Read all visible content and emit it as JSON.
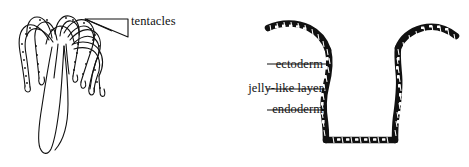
{
  "figure": {
    "background_color": "#ffffff",
    "ink_color": "#000000",
    "panels": [
      {
        "id": "hydra-whole-organism",
        "side": "left",
        "description": "whole hydra with drooping tentacles and tapering body"
      },
      {
        "id": "hydra-body-wall-cross-section",
        "side": "right",
        "description": "longitudinal section showing three body wall layers"
      }
    ]
  },
  "labels": {
    "tentacles": "tentacles",
    "ectoderm": "ectoderm",
    "jelly_like_layer": "jelly-like layer",
    "endoderm": "endoderm"
  },
  "pointers": {
    "tentacles_pointer": "triangle-pointer",
    "ectoderm_leader": "leader-line",
    "jelly_leader": "leader-line",
    "endoderm_leader": "leader-line"
  }
}
